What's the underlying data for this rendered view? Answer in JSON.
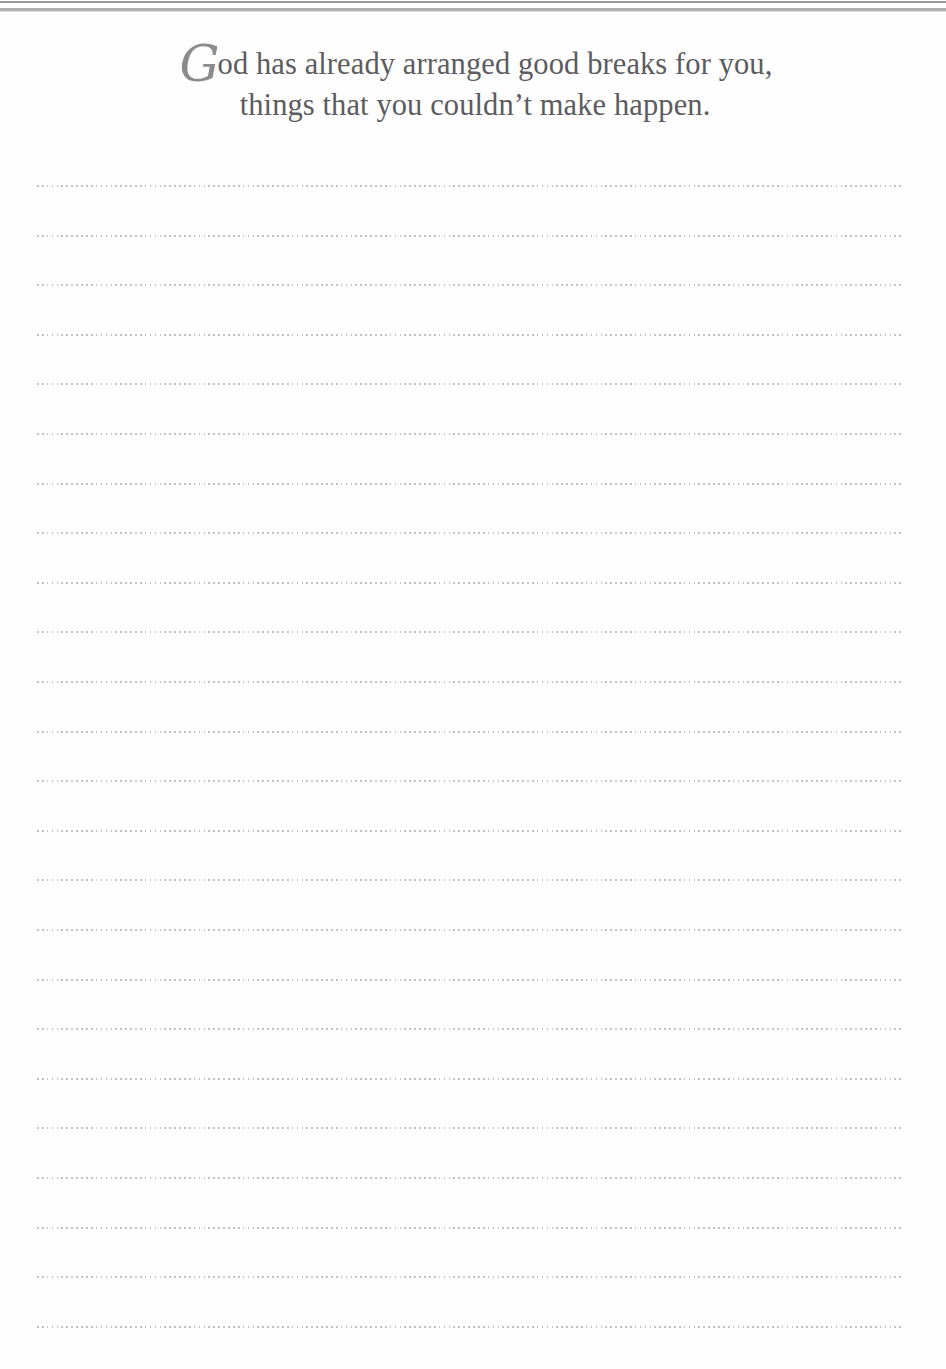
{
  "page": {
    "type": "lined-journal-page",
    "width": 946,
    "height": 1369,
    "background_color": "#fefefe"
  },
  "header": {
    "top_rule_color": "#8d8f93",
    "top_rule_secondary_color": "#9a9ca0"
  },
  "quote": {
    "dropcap": "G",
    "line_1_rest": "od has already arranged good breaks for you,",
    "line_2": "things that you couldn’t make happen.",
    "full_text": "God has already arranged good breaks for you, things that you couldn’t make happen.",
    "text_color": "#5c5c5e",
    "dropcap_color": "#8b8b8d"
  },
  "ruled_area": {
    "line_count": 24,
    "first_line_y": 185,
    "line_spacing": 49.6,
    "line_left": 37,
    "line_right": 901,
    "line_color": "#9b9ba4",
    "style": "dotted"
  }
}
